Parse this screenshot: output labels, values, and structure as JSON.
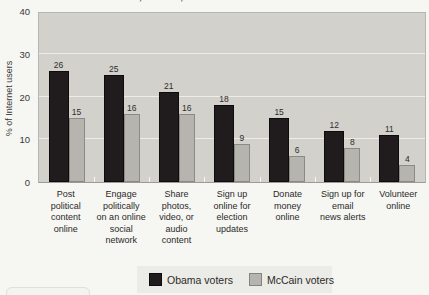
{
  "colors": {
    "page_background": "#f6f6f3",
    "plot_background": "#d2d1cc",
    "gridline": "#edece8",
    "obama_bar": "#201c1e",
    "mccain_bar": "#b5b4af",
    "mccain_bar_border": "#8b8a84",
    "legend_background": "#ebebe7",
    "text": "#2b2a28"
  },
  "chart_data": {
    "type": "bar",
    "title": "Obama, McCain, and Internet Activism in 2008",
    "ylabel": "% of Internet users",
    "xlabel": "",
    "ylim": [
      0,
      40
    ],
    "yticks": [
      0,
      10,
      20,
      30,
      40
    ],
    "gridlines": [
      10,
      20,
      30
    ],
    "grid": "horizontal white gridlines on gray plot background",
    "legend_position": "bottom center",
    "value_labels": true,
    "categories": [
      "Post political content online",
      "Engage politically on an online social network",
      "Share photos, video, or audio content",
      "Sign up online for election updates",
      "Donate money online",
      "Sign up for email news alerts",
      "Volunteer online"
    ],
    "category_lines": [
      [
        "Post",
        "political",
        "content",
        "online"
      ],
      [
        "Engage",
        "politically",
        "on an online",
        "social",
        "network"
      ],
      [
        "Share",
        "photos,",
        "video, or",
        "audio",
        "content"
      ],
      [
        "Sign up",
        "online for",
        "election",
        "updates"
      ],
      [
        "Donate",
        "money",
        "online"
      ],
      [
        "Sign up for",
        "email",
        "news alerts"
      ],
      [
        "Volunteer",
        "online"
      ]
    ],
    "series": [
      {
        "name": "Obama voters",
        "color": "#201c1e",
        "values": [
          26,
          25,
          21,
          18,
          15,
          12,
          11
        ]
      },
      {
        "name": "McCain voters",
        "color": "#b5b4af",
        "values": [
          15,
          16,
          16,
          9,
          6,
          8,
          4
        ]
      }
    ]
  }
}
